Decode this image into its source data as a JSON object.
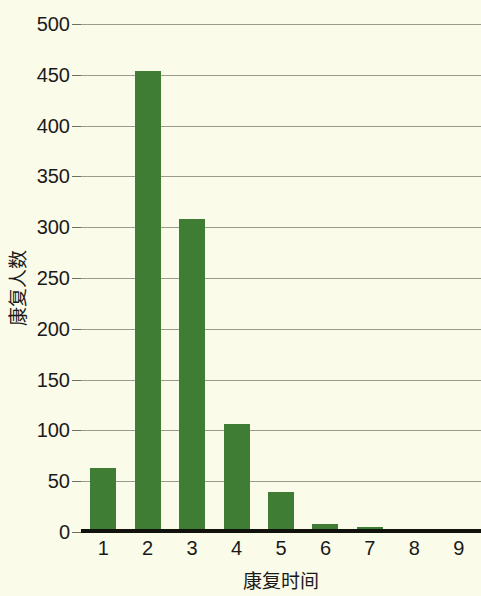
{
  "chart_data": {
    "type": "bar",
    "title": "",
    "xlabel": "康复时间",
    "ylabel": "康复人数",
    "categories": [
      "1",
      "2",
      "3",
      "4",
      "5",
      "6",
      "7",
      "8",
      "9"
    ],
    "values": [
      63,
      454,
      308,
      106,
      39,
      8,
      5,
      2,
      1
    ],
    "series": [
      {
        "name": "康复人数",
        "values": [
          63,
          454,
          308,
          106,
          39,
          8,
          5,
          2,
          1
        ]
      }
    ],
    "ylim": [
      0,
      500
    ],
    "ytick_labels": [
      "500",
      "450",
      "400",
      "350",
      "300",
      "250",
      "200",
      "150",
      "100",
      "50",
      "0"
    ],
    "ytick_values": [
      500,
      450,
      400,
      350,
      300,
      250,
      200,
      150,
      100,
      50,
      0
    ],
    "xtick_labels": [
      "1",
      "2",
      "3",
      "4",
      "5",
      "6",
      "7",
      "8",
      "9"
    ],
    "grid": true,
    "legend": false,
    "legend_position": "none",
    "bar_color": "#3e7d33",
    "background_color": "#fbfbea",
    "gridline_color": "#9a9a8e",
    "axis_color": "#12120c",
    "text_color": "#1a1a1a"
  }
}
